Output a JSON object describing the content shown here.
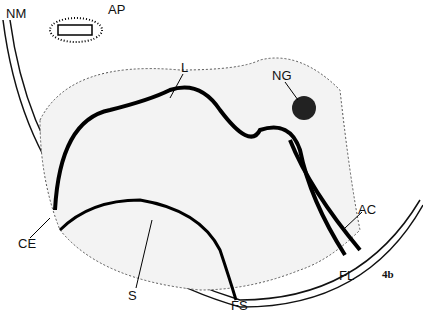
{
  "figure": {
    "id": "4b",
    "labels": [
      {
        "key": "NM",
        "text": "NM",
        "x": 6,
        "y": 6
      },
      {
        "key": "AP",
        "text": "AP",
        "x": 108,
        "y": 2
      },
      {
        "key": "L",
        "text": "L",
        "x": 181,
        "y": 60
      },
      {
        "key": "NG",
        "text": "NG",
        "x": 272,
        "y": 68
      },
      {
        "key": "AC",
        "text": "AC",
        "x": 358,
        "y": 202
      },
      {
        "key": "CE",
        "text": "CE",
        "x": 18,
        "y": 236
      },
      {
        "key": "S",
        "text": "S",
        "x": 128,
        "y": 288
      },
      {
        "key": "FL",
        "text": "FL",
        "x": 339,
        "y": 268
      },
      {
        "key": "FS",
        "text": "FS",
        "x": 231,
        "y": 298
      }
    ]
  }
}
